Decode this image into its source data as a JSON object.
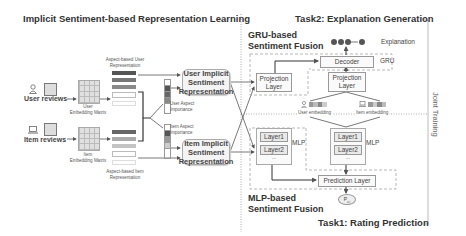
{
  "left_panel": {
    "title": "Implicit Sentiment-based Representation Learning",
    "user_reviews_label": "User reviews",
    "item_reviews_label": "Item reviews",
    "user_embedding_matrix_label": "User\nEmbedding Matrix",
    "item_embedding_matrix_label": "Item\nEmbedding Matrix",
    "aspect_user_rep_label": "Aspect-based User\nRepresentation",
    "aspect_item_rep_label": "Aspect-based Item\nRepresentation",
    "user_aspect_importance_label": "User Aspect\nImportance",
    "item_aspect_importance_label": "Item Aspect\nImportance",
    "user_implicit_rep": "User Implicit\nSentiment\nRepresentation",
    "item_implicit_rep": "Item Implicit\nSentiment\nRepresentation"
  },
  "task2": {
    "title": "Task2: Explanation Generation",
    "gru_fusion_title": "GRU-based\nSentiment Fusion",
    "explanation_label": "Explanation",
    "decoder_label": "Decoder",
    "gru_label": "GRU",
    "projection_layer_left": "Projection\nLayer",
    "projection_layer_right": "Projection\nLayer",
    "user_embedding_label": "User embedding",
    "item_embedding_label": "Item embedding"
  },
  "task1": {
    "title": "Task1: Rating Prediction",
    "mlp_fusion_title": "MLP-based\nSentiment Fusion",
    "mlp_left": {
      "layers": [
        "Layer1",
        "Layer2"
      ],
      "ellipsis": "...",
      "label": "MLP"
    },
    "mlp_right": {
      "layers": [
        "Layer1",
        "Layer2"
      ],
      "ellipsis": "...",
      "label": "MLP"
    },
    "prediction_layer_label": "Prediction Layer",
    "output_label": "P",
    "output_subscript": "u,i"
  },
  "joint_training_label": "Joint Training",
  "colors": {
    "dark_block": "#555555",
    "mid_block": "#8a8a8a",
    "light_block": "#c4c4c4",
    "line": "#555555",
    "dashed": "#999999"
  }
}
